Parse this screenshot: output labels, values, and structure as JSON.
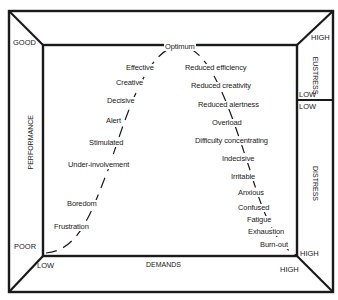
{
  "axes": {
    "y_title": "PERFORMANCE",
    "y_top": "GOOD",
    "y_bottom": "POOR",
    "x_title": "DEMANDS",
    "x_left": "LOW",
    "x_right": "HIGH",
    "stress_right_top": "HIGH",
    "stress_right_bottom": "HIGH"
  },
  "right_panel": {
    "eustress": {
      "title": "EUSTRESS",
      "top": "HIGH",
      "bottom": "LOW"
    },
    "distress": {
      "title": "DISTRESS",
      "top": "LOW",
      "bottom": "HIGH"
    }
  },
  "curve": {
    "peak": "Optimum",
    "rising": [
      "Effective",
      "Creative",
      "Decisive",
      "Alert",
      "Stimulated",
      "Under-involvement",
      "Boredom",
      "Frustration"
    ],
    "falling": [
      "Reduced efficiency",
      "Reduced creativity",
      "Reduced alertness",
      "Overload",
      "Difficulty concentrating",
      "Indecisive",
      "Irritable",
      "Anxious",
      "Confused",
      "Fatigue",
      "Exhaustion",
      "Burn-out"
    ]
  },
  "colors": {
    "line": "#1a1a1a",
    "background": "#ffffff"
  }
}
